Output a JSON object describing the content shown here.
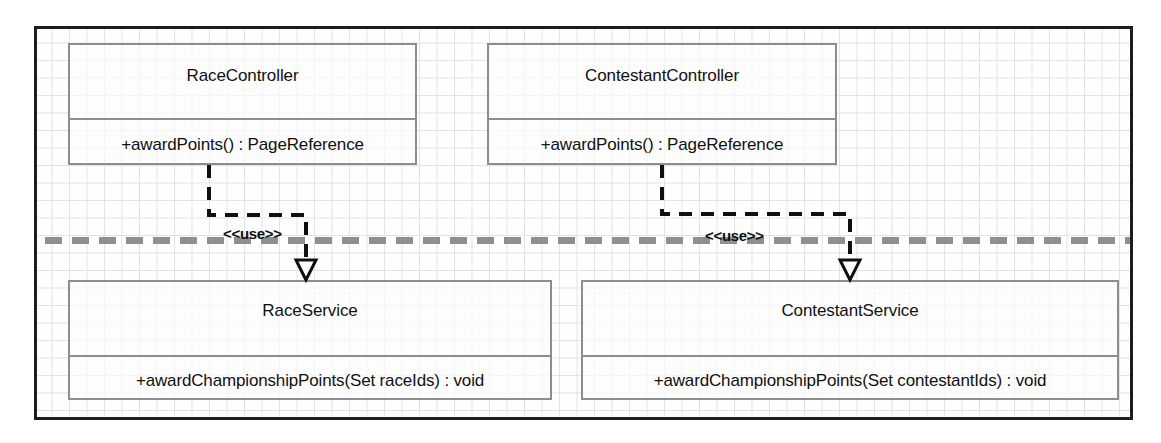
{
  "diagram": {
    "background_color": "#fefefe",
    "grid_color": "#e3e3e3",
    "frame_color": "#1d1d1d",
    "class_border_color": "#8d8d8d",
    "separator_color": "#8f8f8f",
    "connector_color": "#101010"
  },
  "classes": [
    {
      "id": "race-controller",
      "name": "RaceController",
      "operations": [
        "+awardPoints() : PageReference"
      ]
    },
    {
      "id": "contestant-controller",
      "name": "ContestantController",
      "operations": [
        "+awardPoints() : PageReference"
      ]
    },
    {
      "id": "race-service",
      "name": "RaceService",
      "operations": [
        "+awardChampionshipPoints(Set raceIds) : void"
      ]
    },
    {
      "id": "contestant-service",
      "name": "ContestantService",
      "operations": [
        "+awardChampionshipPoints(Set contestantIds) : void"
      ]
    }
  ],
  "dependencies": [
    {
      "id": "use-left",
      "stereotype": "<<use>>",
      "from": "RaceController",
      "to": "RaceService"
    },
    {
      "id": "use-right",
      "stereotype": "<<use>>",
      "from": "ContestantController",
      "to": "ContestantService"
    }
  ]
}
